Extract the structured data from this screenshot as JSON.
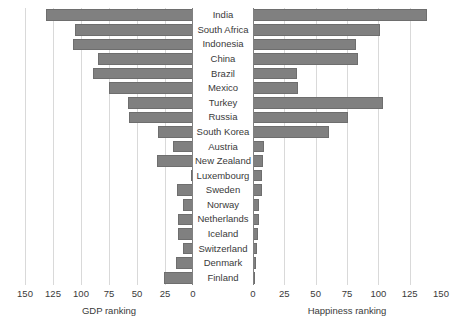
{
  "chart_data": {
    "type": "bar",
    "orientation": "horizontal",
    "layout": "butterfly-two-panel",
    "title": "",
    "categories": [
      "India",
      "South Africa",
      "Indonesia",
      "China",
      "Brazil",
      "Mexico",
      "Turkey",
      "Russia",
      "South Korea",
      "Austria",
      "New Zealand",
      "Luxembourg",
      "Sweden",
      "Norway",
      "Netherlands",
      "Iceland",
      "Switzerland",
      "Denmark",
      "Finland"
    ],
    "series": [
      {
        "name": "GDP ranking",
        "panel": "left",
        "axis_reversed": true,
        "values": [
          131,
          105,
          107,
          85,
          89,
          75,
          58,
          57,
          31,
          18,
          32,
          1,
          14,
          9,
          13,
          13,
          9,
          15,
          26
        ]
      },
      {
        "name": "Happiness ranking",
        "panel": "right",
        "axis_reversed": false,
        "values": [
          139,
          101,
          82,
          84,
          35,
          36,
          104,
          76,
          61,
          9,
          8,
          7,
          7,
          5,
          5,
          4,
          3,
          2,
          1
        ]
      }
    ],
    "left_panel": {
      "xlabel": "GDP ranking",
      "xlim": [
        150,
        0
      ],
      "ticks": [
        150,
        125,
        100,
        75,
        50,
        25,
        0
      ],
      "tick_labels": [
        "150",
        "125",
        "100",
        "75",
        "50",
        "25",
        "0"
      ],
      "grid": true
    },
    "right_panel": {
      "xlabel": "Happiness ranking",
      "xlim": [
        0,
        150
      ],
      "ticks": [
        0,
        25,
        50,
        75,
        100,
        125,
        150
      ],
      "tick_labels": [
        "0",
        "25",
        "50",
        "75",
        "100",
        "125",
        "150"
      ],
      "grid": true
    },
    "colors": {
      "bar": "#808080",
      "bar_border": "#6e6e6e",
      "gridline": "#d9d9d9",
      "axis": "#808080",
      "text": "#3a3a3a",
      "background": "#ffffff"
    },
    "legend": null,
    "ylabel": ""
  }
}
